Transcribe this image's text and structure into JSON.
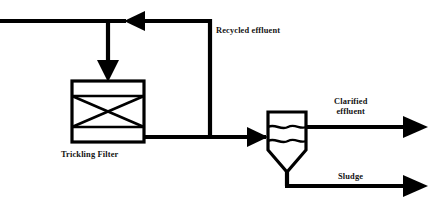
{
  "diagram": {
    "type": "process-flow-diagram",
    "background_color": "#ffffff",
    "line_color": "#000000",
    "text_color": "#131313",
    "labels": {
      "recycled_effluent": "Recycled effluent",
      "trickling_filter": "Trickling Filter",
      "clarified_effluent_line1": "Clarified",
      "clarified_effluent_line2": "effluent",
      "sludge": "Sludge"
    },
    "units": [
      {
        "name": "trickling-filter",
        "label": "Trickling Filter",
        "shape": "rectangle-with-media-cross",
        "bands": 3,
        "x": 72,
        "y": 81,
        "width": 72,
        "height": 61
      },
      {
        "name": "secondary-clarifier",
        "label": "",
        "shape": "rectangle-with-hopper",
        "water_lines": 2,
        "x": 268,
        "y": 112,
        "width": 38,
        "height": 38,
        "hopper_apex_y": 172
      }
    ],
    "streams": [
      {
        "name": "influent",
        "label": "",
        "direction": "right",
        "y": 21
      },
      {
        "name": "recycled-effluent",
        "label": "Recycled effluent",
        "direction": "left"
      },
      {
        "name": "filter-feed",
        "label": "",
        "direction": "down"
      },
      {
        "name": "filter-effluent",
        "label": "",
        "direction": "right",
        "y": 137
      },
      {
        "name": "clarified-effluent",
        "label": "Clarified effluent",
        "direction": "right",
        "y": 127
      },
      {
        "name": "sludge",
        "label": "Sludge",
        "direction": "right",
        "y": 186
      }
    ]
  }
}
